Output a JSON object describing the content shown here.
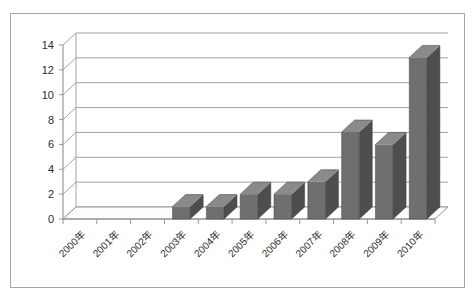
{
  "chart_data": {
    "type": "bar",
    "title": "",
    "subtitle": "",
    "xlabel": "",
    "ylabel": "",
    "categories": [
      "2000年",
      "2001年",
      "2002年",
      "2003年",
      "2004年",
      "2005年",
      "2006年",
      "2007年",
      "2008年",
      "2009年",
      "2010年"
    ],
    "values": [
      0,
      0,
      0,
      1,
      1,
      2,
      2,
      3,
      7,
      6,
      13
    ],
    "series": [
      {
        "name": "",
        "values": [
          0,
          0,
          0,
          1,
          1,
          2,
          2,
          3,
          7,
          6,
          13
        ]
      }
    ],
    "ylim": [
      0,
      14
    ],
    "ytick_labels": [
      "0",
      "2",
      "4",
      "6",
      "8",
      "10",
      "12",
      "14"
    ],
    "ytick_values": [
      0,
      2,
      4,
      6,
      8,
      10,
      12,
      14
    ],
    "grid": true,
    "legend": false,
    "legend_position": "none",
    "style": "3d-column",
    "colors": {
      "bar_front": "#6f6f6f",
      "bar_side": "#4e4e4e",
      "bar_top": "#8a8a8a",
      "gridline": "#9a9a9a",
      "axis": "#8c8c8c",
      "frame_border": "#a6a6a6",
      "background": "#ffffff",
      "text": "#2b2b2b"
    }
  }
}
